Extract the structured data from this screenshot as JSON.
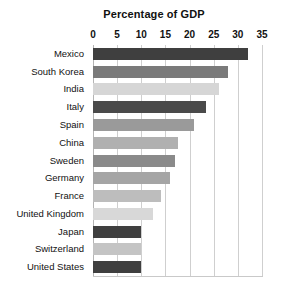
{
  "chart_data": {
    "type": "bar",
    "orientation": "horizontal",
    "title": "Percentage of GDP",
    "xlabel": "",
    "ylabel": "",
    "xlim": [
      0,
      35
    ],
    "xticks": [
      0,
      5,
      10,
      15,
      20,
      25,
      30,
      35
    ],
    "grid": true,
    "legend": "none",
    "categories": [
      "Mexico",
      "South Korea",
      "India",
      "Italy",
      "Spain",
      "China",
      "Sweden",
      "Germany",
      "France",
      "United Kingdom",
      "Japan",
      "Switzerland",
      "United States"
    ],
    "values": [
      32,
      28,
      26,
      23.5,
      21,
      17.5,
      17,
      16,
      14,
      12.5,
      10,
      10,
      10
    ],
    "bar_colors": [
      "#3f3f3f",
      "#7a7a7a",
      "#d6d6d6",
      "#4a4a4a",
      "#9a9a9a",
      "#b0b0b0",
      "#8a8a8a",
      "#a5a5a5",
      "#bdbdbd",
      "#d8d8d8",
      "#3f3f3f",
      "#c4c4c4",
      "#3f3f3f"
    ],
    "grid_color": "#cfcfcf",
    "text_color": "#111111",
    "background": "#ffffff"
  }
}
